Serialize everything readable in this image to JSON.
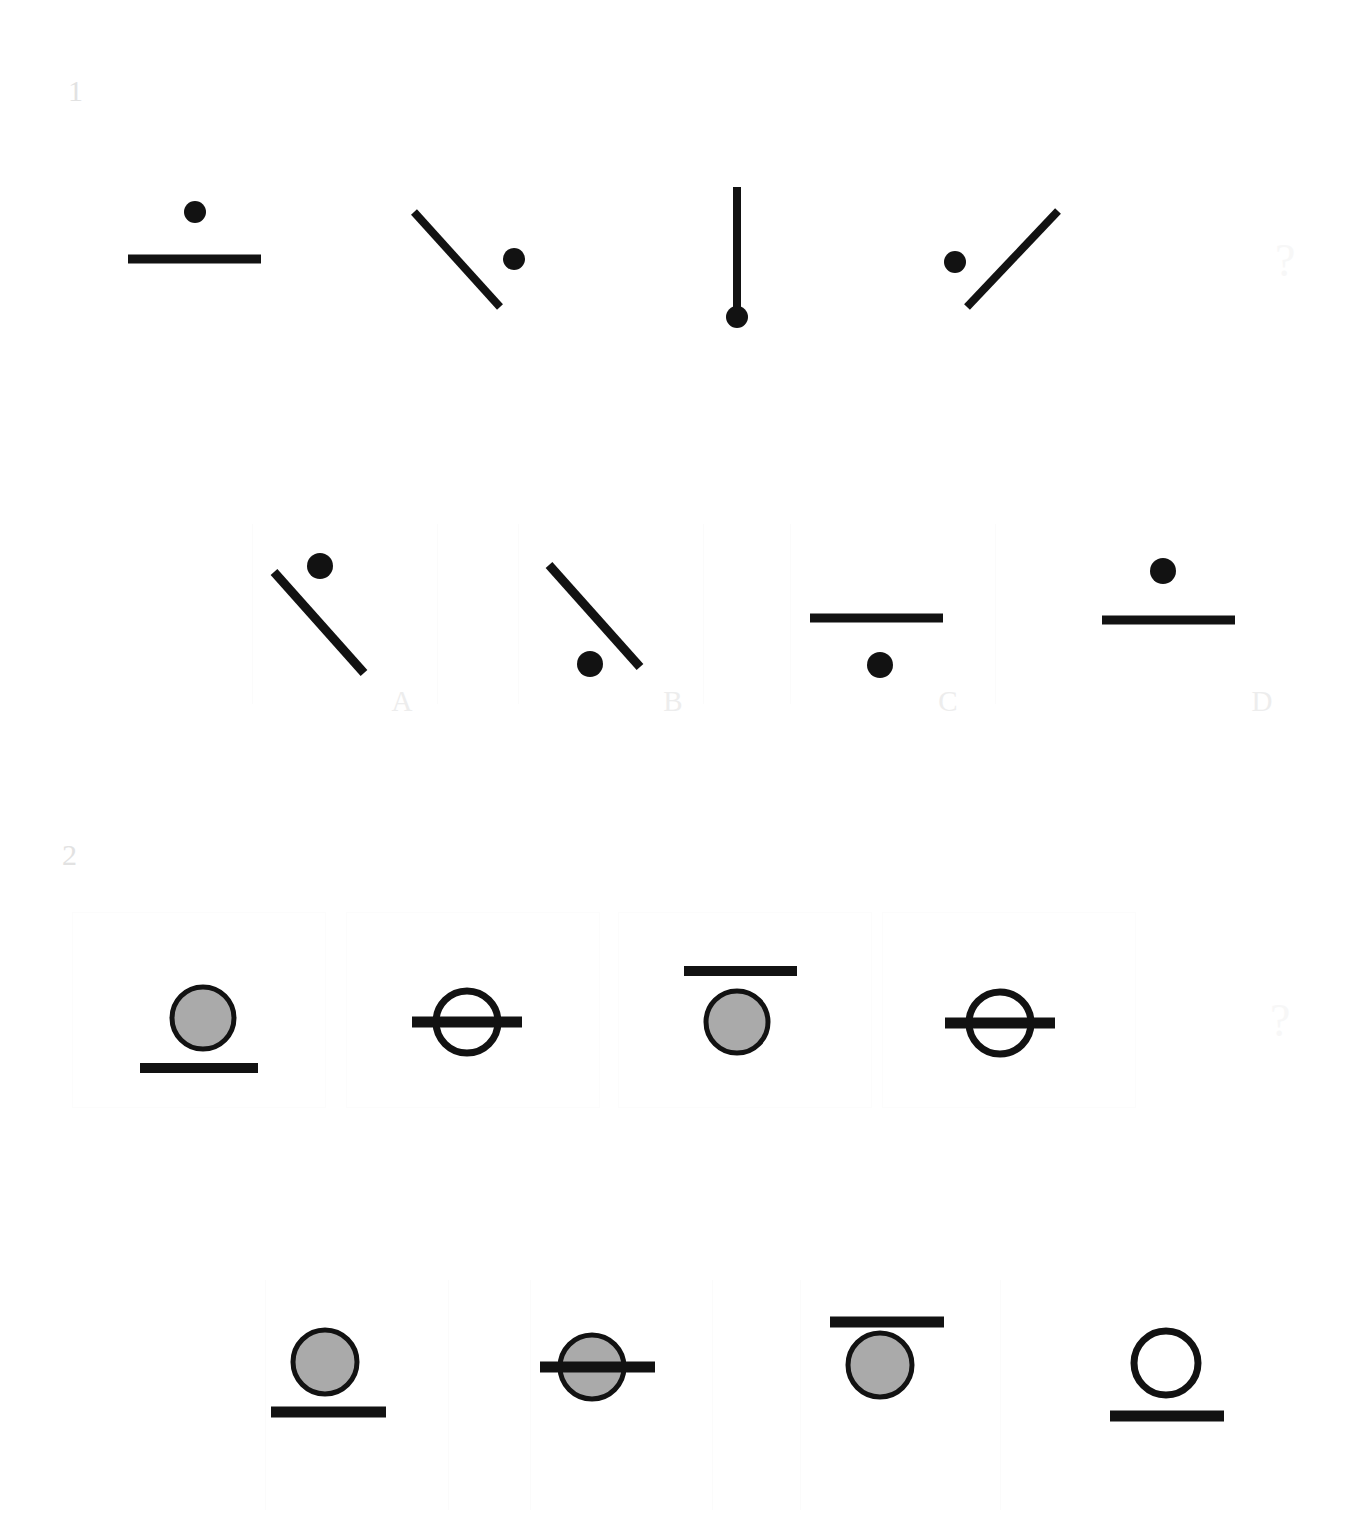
{
  "page": {
    "background": "#ffffff",
    "width": 1361,
    "height": 1539,
    "ink_color": "#121212",
    "fill_gray": "#aaaaaa",
    "faint_label_color": "#ededed",
    "puzzle_index_color": "#e2e2e2"
  },
  "puzzles": [
    {
      "index_label": "1",
      "question_mark": "?",
      "stem": {
        "items": [
          {
            "name": "dot-above-horizontal-line",
            "description": "thick horizontal line with a filled black dot centered above it",
            "line": {
              "orientation": "horizontal",
              "x1": 128,
              "y1": 259,
              "x2": 261,
              "y2": 259
            },
            "dot": {
              "cx": 195,
              "cy": 212,
              "r": 11,
              "fill": "solid-black"
            }
          },
          {
            "name": "dot-right-of-backslash-line",
            "description": "line sloping down to the right with a filled black dot to its upper right",
            "line": {
              "orientation": "diagonal-down-right",
              "x1": 414,
              "y1": 212,
              "x2": 500,
              "y2": 307
            },
            "dot": {
              "cx": 514,
              "cy": 259,
              "r": 11,
              "fill": "solid-black"
            }
          },
          {
            "name": "dot-at-bottom-of-vertical-line",
            "description": "vertical line with a filled black dot at its lower end",
            "line": {
              "orientation": "vertical",
              "x1": 737,
              "y1": 187,
              "x2": 737,
              "y2": 315
            },
            "dot": {
              "cx": 737,
              "cy": 317,
              "r": 11,
              "fill": "solid-black"
            }
          },
          {
            "name": "dot-left-of-forwardslash-line",
            "description": "line sloping up to the right with a filled black dot to its upper left",
            "line": {
              "orientation": "diagonal-up-right",
              "x1": 967,
              "y1": 307,
              "x2": 1058,
              "y2": 211
            },
            "dot": {
              "cx": 955,
              "cy": 262,
              "r": 11,
              "fill": "solid-black"
            }
          }
        ]
      },
      "options": [
        {
          "label": "A",
          "name": "dot-above-backslash-line",
          "description": "line sloping down to the right with a filled black dot above its upper end",
          "line": {
            "orientation": "diagonal-down-right",
            "x1": 274,
            "y1": 572,
            "x2": 364,
            "y2": 673
          },
          "dot": {
            "cx": 320,
            "cy": 566,
            "r": 13,
            "fill": "solid-black"
          }
        },
        {
          "label": "B",
          "name": "dot-below-backslash-line",
          "description": "line sloping down to the right with a filled black dot below its lower end",
          "line": {
            "orientation": "diagonal-down-right",
            "x1": 549,
            "y1": 565,
            "x2": 640,
            "y2": 667
          },
          "dot": {
            "cx": 590,
            "cy": 664,
            "r": 13,
            "fill": "solid-black"
          }
        },
        {
          "label": "C",
          "name": "dot-below-horizontal-line",
          "description": "thick horizontal line with a filled black dot centered below it",
          "line": {
            "orientation": "horizontal",
            "x1": 810,
            "y1": 618,
            "x2": 943,
            "y2": 618
          },
          "dot": {
            "cx": 880,
            "cy": 665,
            "r": 13,
            "fill": "solid-black"
          }
        },
        {
          "label": "D",
          "name": "dot-above-horizontal-line",
          "description": "thick horizontal line with a filled black dot centered above it",
          "line": {
            "orientation": "horizontal",
            "x1": 1102,
            "y1": 620,
            "x2": 1235,
            "y2": 620
          },
          "dot": {
            "cx": 1163,
            "cy": 571,
            "r": 13,
            "fill": "solid-black"
          }
        }
      ]
    },
    {
      "index_label": "2",
      "question_mark": "?",
      "stem": {
        "items": [
          {
            "name": "gray-circle-above-line",
            "description": "gray filled circle resting above a thick horizontal line",
            "circle": {
              "cx": 203,
              "cy": 1018,
              "r": 31,
              "fill": "gray"
            },
            "line": {
              "x1": 140,
              "y1": 1068,
              "x2": 258,
              "y2": 1068,
              "position": "below-circle"
            }
          },
          {
            "name": "white-circle-crossed-by-line",
            "description": "open white circle with a thick horizontal line passing through its middle",
            "circle": {
              "cx": 467,
              "cy": 1022,
              "r": 31,
              "fill": "white"
            },
            "line": {
              "x1": 412,
              "y1": 1022,
              "x2": 522,
              "y2": 1022,
              "position": "through-circle"
            }
          },
          {
            "name": "gray-circle-below-line",
            "description": "gray filled circle hanging below a thick horizontal line",
            "circle": {
              "cx": 737,
              "cy": 1022,
              "r": 31,
              "fill": "gray"
            },
            "line": {
              "x1": 684,
              "y1": 971,
              "x2": 797,
              "y2": 971,
              "position": "above-circle"
            }
          },
          {
            "name": "white-circle-crossed-by-line",
            "description": "open white circle with a thick horizontal line passing through its middle",
            "circle": {
              "cx": 1000,
              "cy": 1023,
              "r": 31,
              "fill": "white"
            },
            "line": {
              "x1": 945,
              "y1": 1023,
              "x2": 1055,
              "y2": 1023,
              "position": "through-circle"
            }
          }
        ]
      },
      "options": [
        {
          "label": "A",
          "name": "gray-circle-above-line",
          "description": "gray filled circle resting above a thick horizontal line",
          "circle": {
            "cx": 325,
            "cy": 1362,
            "r": 32,
            "fill": "gray"
          },
          "line": {
            "x1": 271,
            "y1": 1412,
            "x2": 386,
            "y2": 1412,
            "position": "below-circle"
          }
        },
        {
          "label": "B",
          "name": "gray-circle-crossed-by-line",
          "description": "gray filled circle with a thick horizontal line passing through its middle",
          "circle": {
            "cx": 592,
            "cy": 1367,
            "r": 32,
            "fill": "gray"
          },
          "line": {
            "x1": 540,
            "y1": 1367,
            "x2": 655,
            "y2": 1367,
            "position": "through-circle"
          }
        },
        {
          "label": "C",
          "name": "gray-circle-below-line",
          "description": "gray filled circle hanging below a thick horizontal line",
          "circle": {
            "cx": 880,
            "cy": 1365,
            "r": 32,
            "fill": "gray"
          },
          "line": {
            "x1": 830,
            "y1": 1322,
            "x2": 944,
            "y2": 1322,
            "position": "above-circle"
          }
        },
        {
          "label": "D",
          "name": "white-circle-above-line",
          "description": "open white circle resting above a thick horizontal line",
          "circle": {
            "cx": 1166,
            "cy": 1363,
            "r": 32,
            "fill": "white"
          },
          "line": {
            "x1": 1110,
            "y1": 1416,
            "x2": 1224,
            "y2": 1416,
            "position": "below-circle"
          }
        }
      ]
    }
  ]
}
